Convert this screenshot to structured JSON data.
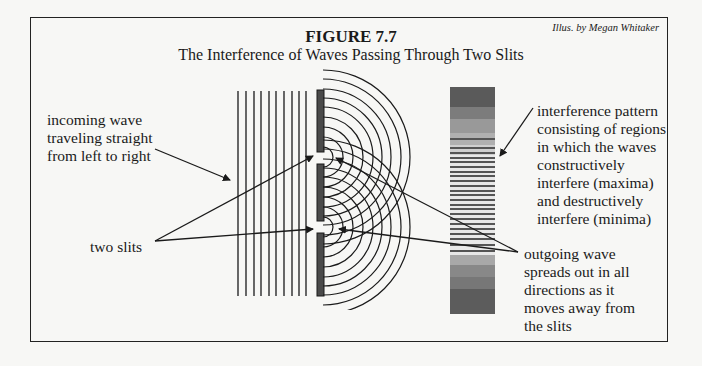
{
  "figure": {
    "credit": "Illus. by Megan Whitaker",
    "number": "FIGURE 7.7",
    "title": "The Interference of Waves Passing Through Two Slits"
  },
  "labels": {
    "incoming_wave": [
      "incoming wave",
      "traveling straight",
      "from left to right"
    ],
    "two_slits": "two slits",
    "interference_pattern": [
      "interference pattern",
      "consisting of regions",
      "in which the waves",
      "constructively",
      "interfere (maxima)",
      "and destructively",
      "interfere (minima)"
    ],
    "outgoing_wave": [
      "outgoing wave",
      "spreads out in all",
      "directions as it",
      "moves away from",
      "the slits"
    ]
  },
  "colors": {
    "ink": "#1a1a1a",
    "barrier": "#4a4a4a",
    "background": "#f7f7f5"
  }
}
